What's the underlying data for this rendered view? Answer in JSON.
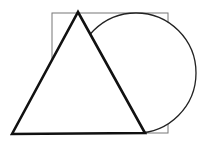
{
  "diagram": {
    "title": "Triangle overlapping a square and a circle",
    "background": "#ffffff",
    "shapes": [
      {
        "name": "square",
        "x": 52,
        "y": 13,
        "width": 116,
        "height": 120,
        "stroke": "#777777",
        "stroke_width": 1
      },
      {
        "name": "circle",
        "cx": 136,
        "cy": 73,
        "r": 60,
        "stroke": "#222222",
        "stroke_width": 1.3
      },
      {
        "name": "triangle",
        "points": [
          [
            12,
            134
          ],
          [
            78,
            12
          ],
          [
            145,
            133
          ]
        ],
        "stroke": "#111111",
        "stroke_width": 2.6,
        "fill": "#ffffff"
      }
    ]
  }
}
